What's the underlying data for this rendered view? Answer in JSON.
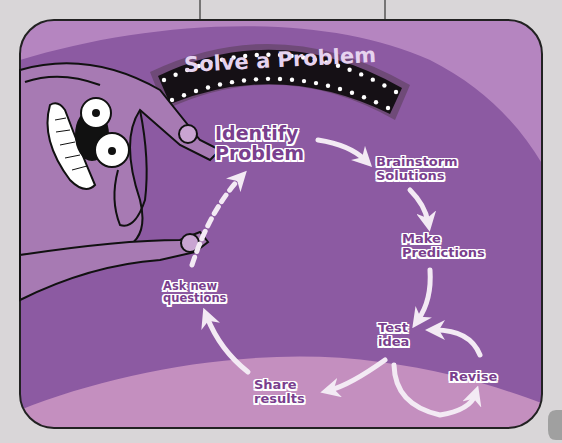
{
  "title": "Solve a Problem",
  "colors": {
    "page_background": "#d9d6d8",
    "panel_background": "#8c5aa2",
    "upper_arc": "#b585c0",
    "lower_band": "#c48fbf",
    "label_text": "#7a3f8e",
    "arrow": "#f3eaf4",
    "sign_background": "#151015",
    "sign_text": "#e6d3ef"
  },
  "steps": [
    {
      "id": "identify",
      "lines": [
        "Identify",
        "Problem"
      ]
    },
    {
      "id": "brainstorm",
      "lines": [
        "Brainstorm",
        "Solutions"
      ]
    },
    {
      "id": "predict",
      "lines": [
        "Make",
        "Predictions"
      ]
    },
    {
      "id": "test",
      "lines": [
        "Test",
        "idea"
      ]
    },
    {
      "id": "revise",
      "lines": [
        "Revise"
      ]
    },
    {
      "id": "share",
      "lines": [
        "Share",
        "results"
      ]
    },
    {
      "id": "ask",
      "lines": [
        "Ask new",
        "questions"
      ]
    }
  ],
  "connections": [
    {
      "from": "identify",
      "to": "brainstorm",
      "style": "solid"
    },
    {
      "from": "brainstorm",
      "to": "predict",
      "style": "solid"
    },
    {
      "from": "predict",
      "to": "test",
      "style": "solid"
    },
    {
      "from": "test",
      "to": "revise",
      "style": "solid"
    },
    {
      "from": "revise",
      "to": "test",
      "style": "solid"
    },
    {
      "from": "test",
      "to": "share",
      "style": "solid"
    },
    {
      "from": "share",
      "to": "ask",
      "style": "solid"
    },
    {
      "from": "ask",
      "to": "identify",
      "style": "dashed"
    }
  ],
  "character": "cartoon-dog"
}
